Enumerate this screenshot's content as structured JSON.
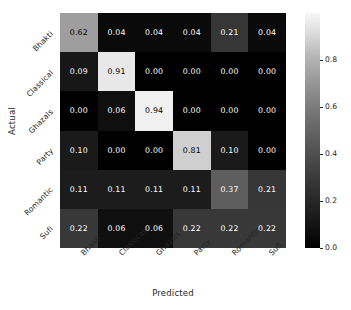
{
  "chart_data": {
    "type": "heatmap",
    "title": "",
    "xlabel": "Predicted",
    "ylabel": "Actual",
    "categories_x": [
      "Bhakti",
      "Classical",
      "Ghazals",
      "Party",
      "Romantic",
      "Sufi"
    ],
    "categories_y": [
      "Bhakti",
      "Classical",
      "Ghazals",
      "Party",
      "Romantic",
      "Sufi"
    ],
    "rows": [
      {
        "label": "Bhakti",
        "values": [
          0.62,
          0.04,
          0.04,
          0.04,
          0.21,
          0.04
        ]
      },
      {
        "label": "Classical",
        "values": [
          0.09,
          0.91,
          0.0,
          0.0,
          0.0,
          0.0
        ]
      },
      {
        "label": "Ghazals",
        "values": [
          0.0,
          0.06,
          0.94,
          0.0,
          0.0,
          0.0
        ]
      },
      {
        "label": "Party",
        "values": [
          0.1,
          0.0,
          0.0,
          0.81,
          0.1,
          0.0
        ]
      },
      {
        "label": "Romantic",
        "values": [
          0.11,
          0.11,
          0.11,
          0.11,
          0.37,
          0.21
        ]
      },
      {
        "label": "Sufi",
        "values": [
          0.22,
          0.06,
          0.06,
          0.22,
          0.22,
          0.22
        ]
      }
    ],
    "cell_labels": [
      [
        "0.62",
        "0.04",
        "0.04",
        "0.04",
        "0.21",
        "0.04"
      ],
      [
        "0.09",
        "0.91",
        "0.00",
        "0.00",
        "0.00",
        "0.00"
      ],
      [
        "0.00",
        "0.06",
        "0.94",
        "0.00",
        "0.00",
        "0.00"
      ],
      [
        "0.10",
        "0.00",
        "0.00",
        "0.81",
        "0.10",
        "0.00"
      ],
      [
        "0.11",
        "0.11",
        "0.11",
        "0.11",
        "0.37",
        "0.21"
      ],
      [
        "0.22",
        "0.06",
        "0.06",
        "0.22",
        "0.22",
        "0.22"
      ]
    ],
    "colormap": "gray",
    "vmin": 0.0,
    "vmax": 1.0,
    "grid": false,
    "legend_position": "right",
    "colorbar": {
      "ticks": [
        0.0,
        0.2,
        0.4,
        0.6,
        0.8
      ],
      "tick_labels": [
        "0.0",
        "0.2",
        "0.4",
        "0.6",
        "0.8"
      ],
      "orientation": "vertical"
    }
  },
  "colors": {
    "background": "#ffffff",
    "text": "#262626",
    "cell_text_light": "#ffffff",
    "cell_text_dark": "#000000"
  }
}
